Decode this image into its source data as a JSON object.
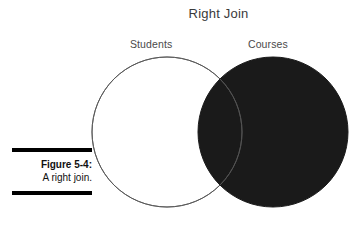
{
  "figure": {
    "title": "Right Join",
    "caption_number": "Figure 5-4:",
    "caption_text": "A right join.",
    "background_color": "#ffffff",
    "fill_color": "#1a1a1a",
    "outline_color": "#555555",
    "title_color": "#3a3a3a",
    "label_color": "#4a4a4a"
  },
  "labels": {
    "left_set": "Students",
    "right_set": "Courses"
  },
  "chart_data": {
    "type": "diagram",
    "diagram_kind": "venn-2-set",
    "title": "Right Join",
    "sets": [
      {
        "name": "Students",
        "position": "left",
        "center_x": 167,
        "center_y": 132,
        "radius": 75,
        "fill": "none",
        "stroke": "#555555",
        "shaded": false
      },
      {
        "name": "Courses",
        "position": "right",
        "center_x": 273,
        "center_y": 132,
        "radius": 75,
        "fill": "#1a1a1a",
        "stroke": "#1a1a1a",
        "shaded": true
      }
    ],
    "regions": [
      {
        "id": "left-only",
        "label": "Students only",
        "shaded": false
      },
      {
        "id": "intersection",
        "label": "Students AND Courses",
        "shaded": true
      },
      {
        "id": "right-only",
        "label": "Courses only",
        "shaded": true
      }
    ],
    "legend": null,
    "annotations": [
      "Right Join",
      "Students",
      "Courses"
    ]
  }
}
